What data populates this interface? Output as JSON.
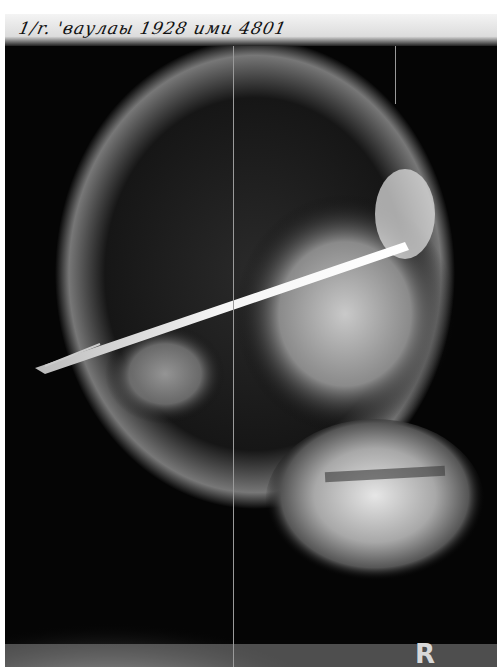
{
  "image": {
    "description": "Lateral skull X-ray radiograph showing a long rod penetrating through the skull from the orbit region toward the back of the head",
    "header_handwriting": "1/r. 'ваулаы 1928 ими 4801",
    "side_marker": "R",
    "colors": {
      "film_background": "#050505",
      "bone": "#e8e8e8",
      "rod": "#f2f2f2",
      "label_strip": "#eeeeee"
    }
  }
}
